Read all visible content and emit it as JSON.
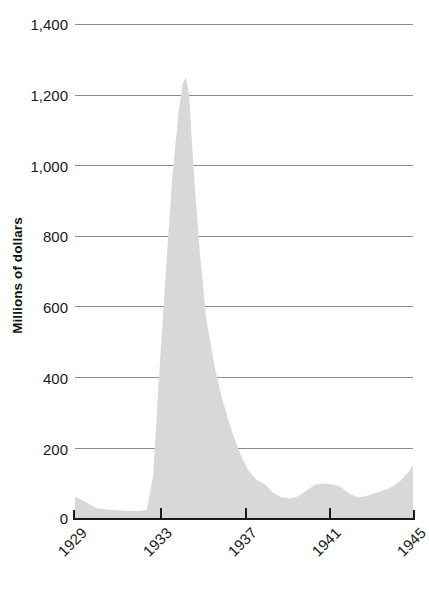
{
  "chart_data": {
    "type": "area",
    "title": "",
    "subtitle": "",
    "xlabel": "",
    "ylabel": "Millions of dollars",
    "xlim": [
      1929,
      1945
    ],
    "ylim": [
      0,
      1400
    ],
    "grid": true,
    "legend": null,
    "fill_color": "#d8d8d8",
    "grid_color": "#8c8c8c",
    "axis_color": "#1a1a1a",
    "y_ticks": [
      0,
      200,
      400,
      600,
      800,
      1000,
      1200,
      1400
    ],
    "y_tick_labels": [
      "0",
      "200",
      "400",
      "600",
      "800",
      "1,000",
      "1,200",
      "1,400"
    ],
    "x_ticks": [
      1929,
      1933,
      1937,
      1941,
      1945
    ],
    "x_tick_labels": [
      "1929",
      "1933",
      "1937",
      "1941",
      "1945"
    ],
    "x": [
      1929,
      1929.5,
      1930,
      1930.5,
      1931,
      1931.5,
      1932,
      1932.4,
      1932.7,
      1933,
      1933.3,
      1933.6,
      1933.9,
      1934.1,
      1934.25,
      1934.4,
      1934.6,
      1934.9,
      1935.2,
      1935.6,
      1936,
      1936.4,
      1936.8,
      1937.2,
      1937.6,
      1938,
      1938.4,
      1938.8,
      1939.2,
      1939.6,
      1940,
      1940.4,
      1940.8,
      1941.2,
      1941.6,
      1942,
      1942.4,
      1942.8,
      1943.2,
      1943.6,
      1944,
      1944.4,
      1944.8,
      1945
    ],
    "y": [
      60,
      45,
      28,
      24,
      22,
      20,
      20,
      22,
      120,
      420,
      700,
      960,
      1150,
      1230,
      1250,
      1200,
      1000,
      760,
      570,
      430,
      330,
      250,
      185,
      135,
      108,
      95,
      70,
      58,
      55,
      62,
      80,
      95,
      98,
      95,
      88,
      68,
      58,
      62,
      70,
      78,
      88,
      105,
      132,
      150
    ],
    "values_note": "Area series, millions of dollars, 1929-1945"
  },
  "axis": {
    "y_title": "Millions of dollars"
  }
}
